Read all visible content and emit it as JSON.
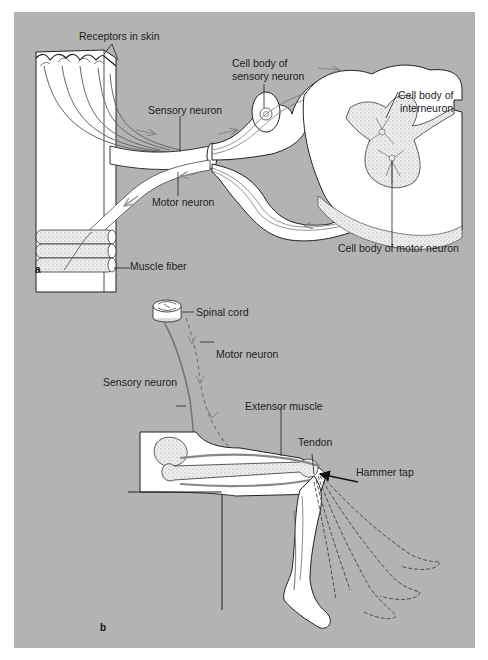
{
  "figure": {
    "background_color": "#b3b3b3",
    "panel_a": {
      "letter": "a",
      "labels": {
        "receptors": "Receptors in skin",
        "cell_body_sensory_1": "Cell body of",
        "cell_body_sensory_2": "sensory neuron",
        "sensory_neuron": "Sensory neuron",
        "cell_body_interneuron_1": "Cell body of",
        "cell_body_interneuron_2": "interneuron",
        "motor_neuron": "Motor neuron",
        "muscle_fiber": "Muscle fiber",
        "cell_body_motor": "Cell body of motor neuron"
      }
    },
    "panel_b": {
      "letter": "b",
      "labels": {
        "spinal_cord": "Spinal cord",
        "motor_neuron": "Motor neuron",
        "sensory_neuron": "Sensory neuron",
        "extensor_muscle": "Extensor muscle",
        "tendon": "Tendon",
        "hammer_tap": "Hammer tap"
      }
    }
  }
}
